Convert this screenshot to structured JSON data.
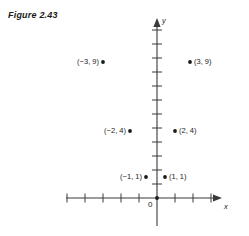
{
  "figure": {
    "title": "Figure 2.43"
  },
  "axes": {
    "x_label": "x",
    "y_label": "y",
    "origin_label": "0",
    "line_color": "#3a3a3a",
    "x_axis_left_px": 66,
    "x_axis_right_px": 222,
    "y_axis_top_px": 18,
    "y_axis_bottom_px": 226,
    "origin_x_px": 157,
    "origin_y_px": 198,
    "x_tick_spacing_px": 18,
    "y_tick_spacing_px": 14,
    "x_ticks_left": 5,
    "x_ticks_right": 4,
    "y_ticks_up": 12,
    "grid": false
  },
  "chart_data": {
    "type": "scatter",
    "title": "Figure 2.43",
    "xlabel": "x",
    "ylabel": "y",
    "grid": false,
    "legend": null,
    "marker_color": "#1a1a1a",
    "xlim": [
      -5,
      4
    ],
    "ylim": [
      -2,
      12
    ],
    "points": [
      {
        "x": -3,
        "y": 9,
        "label": "(−3, 9)",
        "label_side": "left",
        "px": 103,
        "py": 62
      },
      {
        "x": 3,
        "y": 9,
        "label": "(3, 9)",
        "label_side": "right",
        "px": 190,
        "py": 62
      },
      {
        "x": -2,
        "y": 4,
        "label": "(−2, 4)",
        "label_side": "left",
        "px": 130,
        "py": 131
      },
      {
        "x": 2,
        "y": 4,
        "label": "(2, 4)",
        "label_side": "right",
        "px": 175,
        "py": 131
      },
      {
        "x": -1,
        "y": 1,
        "label": "(−1, 1)",
        "label_side": "left",
        "px": 146,
        "py": 177
      },
      {
        "x": 1,
        "y": 1,
        "label": "(1, 1)",
        "label_side": "right",
        "px": 165,
        "py": 177
      },
      {
        "x": 0,
        "y": 0,
        "label": "",
        "label_side": "none",
        "px": 157,
        "py": 198
      }
    ]
  }
}
